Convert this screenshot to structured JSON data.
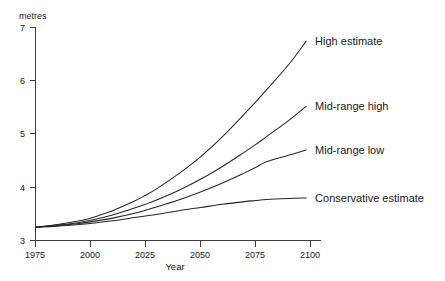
{
  "chart_data": {
    "type": "line",
    "title": "",
    "xlabel": "Year",
    "ylabel": "metres",
    "ylabel_position": "top-left",
    "xlim": [
      1975,
      2100
    ],
    "ylim": [
      3,
      7
    ],
    "grid": false,
    "legend_position": "right-inline-labels",
    "x_ticks": [
      1975,
      2000,
      2025,
      2050,
      2075,
      2100
    ],
    "x_tick_labels": [
      "1975",
      "2000",
      "2025",
      "2050",
      "2075",
      "2100"
    ],
    "y_ticks": [
      3,
      4,
      5,
      6,
      7
    ],
    "y_tick_labels": [
      "3",
      "4",
      "5",
      "6",
      "7"
    ],
    "x": [
      1975,
      1985,
      1995,
      2000,
      2010,
      2020,
      2025,
      2030,
      2040,
      2050,
      2060,
      2070,
      2075,
      2080,
      2090,
      2098
    ],
    "series": [
      {
        "name": "High estimate",
        "label": "High estimate",
        "values": [
          3.25,
          3.3,
          3.37,
          3.42,
          3.56,
          3.74,
          3.85,
          3.97,
          4.25,
          4.57,
          4.95,
          5.38,
          5.6,
          5.83,
          6.3,
          6.74
        ]
      },
      {
        "name": "Mid-range high",
        "label": "Mid-range high",
        "values": [
          3.25,
          3.29,
          3.34,
          3.38,
          3.48,
          3.61,
          3.68,
          3.76,
          3.94,
          4.15,
          4.39,
          4.66,
          4.8,
          4.95,
          5.25,
          5.52
        ]
      },
      {
        "name": "Mid-range low",
        "label": "Mid-range low",
        "values": [
          3.25,
          3.28,
          3.32,
          3.35,
          3.42,
          3.51,
          3.57,
          3.63,
          3.76,
          3.91,
          4.08,
          4.27,
          4.37,
          4.48,
          4.6,
          4.7
        ]
      },
      {
        "name": "Conservative estimate",
        "label": "Conservative estimate",
        "values": [
          3.25,
          3.27,
          3.3,
          3.32,
          3.37,
          3.43,
          3.46,
          3.49,
          3.56,
          3.62,
          3.68,
          3.73,
          3.75,
          3.77,
          3.79,
          3.8
        ]
      }
    ],
    "series_label_anchors": [
      {
        "name": "High estimate",
        "x": 2098,
        "y": 6.74
      },
      {
        "name": "Mid-range high",
        "x": 2098,
        "y": 5.52
      },
      {
        "name": "Mid-range low",
        "x": 2098,
        "y": 4.7
      },
      {
        "name": "Conservative estimate",
        "x": 2098,
        "y": 3.8
      }
    ]
  },
  "colors": {
    "background": "#ffffff",
    "axis": "#3c3c3c",
    "line": "#262626",
    "text": "#1a1a1a"
  }
}
